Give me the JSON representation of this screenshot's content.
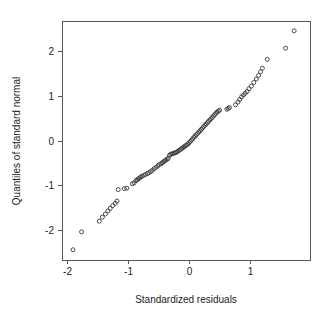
{
  "chart_data": {
    "type": "scatter",
    "title": "",
    "subtitle": "",
    "xlabel": "Standardized residuals",
    "ylabel": "Quantiles of standard normal",
    "xlim": [
      -2.08,
      1.98
    ],
    "ylim": [
      -2.68,
      2.68
    ],
    "xticks": [
      -2,
      -1,
      0,
      1
    ],
    "xtick_labels": [
      "-2",
      "-1",
      "0",
      "1"
    ],
    "yticks": [
      -2,
      -1,
      0,
      1,
      2
    ],
    "ytick_labels": [
      "-2",
      "-1",
      "0",
      "1",
      "2"
    ],
    "grid": false,
    "legend": null,
    "marker": "open-circle",
    "marker_color": "#3a3a3a",
    "n_points": 100,
    "x": [
      -1.9,
      -1.76,
      -1.47,
      -1.42,
      -1.37,
      -1.33,
      -1.29,
      -1.25,
      -1.21,
      -1.18,
      -1.16,
      -1.06,
      -1.02,
      -0.93,
      -0.9,
      -0.87,
      -0.85,
      -0.83,
      -0.81,
      -0.79,
      -0.77,
      -0.74,
      -0.71,
      -0.68,
      -0.66,
      -0.63,
      -0.6,
      -0.57,
      -0.54,
      -0.51,
      -0.49,
      -0.46,
      -0.44,
      -0.42,
      -0.4,
      -0.38,
      -0.36,
      -0.34,
      -0.32,
      -0.3,
      -0.28,
      -0.26,
      -0.24,
      -0.22,
      -0.2,
      -0.18,
      -0.16,
      -0.14,
      -0.12,
      -0.1,
      -0.08,
      -0.06,
      -0.04,
      -0.02,
      0.0,
      0.02,
      0.04,
      0.06,
      0.08,
      0.1,
      0.12,
      0.14,
      0.16,
      0.18,
      0.2,
      0.22,
      0.24,
      0.26,
      0.28,
      0.3,
      0.32,
      0.34,
      0.36,
      0.38,
      0.4,
      0.42,
      0.44,
      0.46,
      0.48,
      0.5,
      0.62,
      0.64,
      0.66,
      0.76,
      0.8,
      0.83,
      0.86,
      0.89,
      0.92,
      0.95,
      0.98,
      1.02,
      1.06,
      1.1,
      1.14,
      1.17,
      1.2,
      1.28,
      1.58,
      1.72
    ],
    "y": [
      -2.45,
      -2.05,
      -1.81,
      -1.72,
      -1.65,
      -1.58,
      -1.52,
      -1.46,
      -1.41,
      -1.36,
      -1.1,
      -1.08,
      -1.07,
      -0.97,
      -0.95,
      -0.9,
      -0.88,
      -0.86,
      -0.84,
      -0.82,
      -0.8,
      -0.78,
      -0.76,
      -0.74,
      -0.72,
      -0.7,
      -0.67,
      -0.63,
      -0.6,
      -0.57,
      -0.54,
      -0.52,
      -0.5,
      -0.48,
      -0.46,
      -0.44,
      -0.42,
      -0.4,
      -0.33,
      -0.31,
      -0.3,
      -0.29,
      -0.28,
      -0.27,
      -0.26,
      -0.24,
      -0.22,
      -0.2,
      -0.18,
      -0.16,
      -0.14,
      -0.12,
      -0.1,
      -0.08,
      -0.05,
      -0.02,
      0.01,
      0.04,
      0.07,
      0.1,
      0.13,
      0.16,
      0.19,
      0.22,
      0.25,
      0.28,
      0.31,
      0.34,
      0.37,
      0.4,
      0.43,
      0.46,
      0.49,
      0.52,
      0.55,
      0.58,
      0.61,
      0.64,
      0.66,
      0.68,
      0.7,
      0.72,
      0.74,
      0.8,
      0.86,
      0.92,
      0.98,
      1.02,
      1.06,
      1.1,
      1.16,
      1.22,
      1.3,
      1.38,
      1.46,
      1.54,
      1.62,
      1.82,
      2.07,
      2.46
    ]
  },
  "plot": {
    "frame": {
      "left": 62,
      "right": 310,
      "top": 21,
      "bottom": 260
    },
    "tick_length": 4
  }
}
